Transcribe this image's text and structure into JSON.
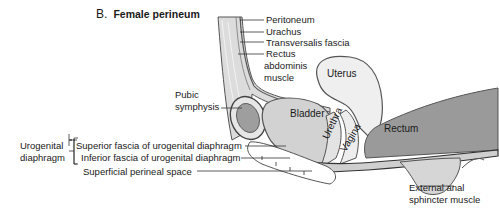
{
  "figure": {
    "letter": "B.",
    "title": "Female perineum"
  },
  "labels": {
    "peritoneum": "Peritoneum",
    "urachus": "Urachus",
    "transversalis_fascia": "Transversalis fascia",
    "rectus_line1": "Rectus",
    "rectus_line2": "abdominis",
    "rectus_line3": "muscle",
    "pubic_line1": "Pubic",
    "pubic_line2": "symphysis",
    "urogenital_line1": "Urogenital",
    "urogenital_line2": "diaphragm",
    "superior_fascia": "Superior fascia of urogenital diaphragm",
    "inferior_fascia": "Inferior fascia of urogenital diaphragm",
    "superficial_space": "Superficial perineal space",
    "anal_line1": "External anal",
    "anal_line2": "sphincter muscle"
  },
  "organs": {
    "uterus": "Uterus",
    "bladder": "Bladder",
    "urethra": "Urethra",
    "vagina": "Vagina",
    "rectum": "Rectum"
  },
  "colors": {
    "organ_light": "#ececec",
    "organ_mid": "#cfcfcf",
    "rectum": "#9a9a9a",
    "outline": "#555555",
    "leader": "#333333"
  }
}
